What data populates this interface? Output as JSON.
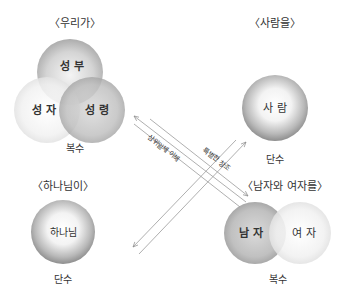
{
  "groups": {
    "we": {
      "title": "〈우리가〉",
      "circles": [
        "성 부",
        "성 자",
        "성 령"
      ],
      "count": "복수"
    },
    "man": {
      "title": "〈사람을〉",
      "circles": [
        "사 람"
      ],
      "count": "단수"
    },
    "god": {
      "title": "〈하나님이〉",
      "circles": [
        "하나님"
      ],
      "count": "단수"
    },
    "male_female": {
      "title": "〈남자와 여자를〉",
      "circles": [
        "남 자",
        "여 자"
      ],
      "count": "복수"
    }
  },
  "arrows": {
    "trinity": "삼위일체 이해",
    "creation": "특별한 창조"
  },
  "colors": {
    "circle_dark": "#8a8a8a",
    "circle_light": "#f4f4f4",
    "line": "#9a9a9a",
    "text": "#333333"
  }
}
